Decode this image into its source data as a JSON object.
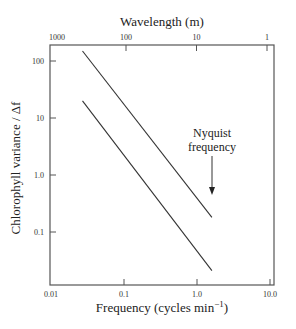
{
  "chart_data": {
    "type": "line",
    "title": "",
    "xlabel": "Frequency (cycles min⁻¹)",
    "ylabel": "Chlorophyll variance / Δf",
    "top_xlabel": "Wavelength (m)",
    "xscale": "log",
    "yscale": "log",
    "xlim": [
      0.01,
      10.0
    ],
    "ylim": [
      0.01,
      200
    ],
    "x_ticks": [
      0.01,
      0.1,
      1.0,
      10.0
    ],
    "x_tick_labels": [
      "0.01",
      "0.1",
      "1.0",
      "10.0"
    ],
    "y_ticks": [
      0.1,
      1.0,
      10,
      100
    ],
    "y_tick_labels": [
      "0.1",
      "1.0",
      "10",
      "100"
    ],
    "top_ticks": [
      1000,
      100,
      10,
      1
    ],
    "top_tick_labels": [
      "1000",
      "100",
      "10",
      "1"
    ],
    "grid": false,
    "legend": null,
    "series": [
      {
        "name": "upper",
        "x": [
          0.027,
          1.6
        ],
        "y": [
          150,
          0.18
        ]
      },
      {
        "name": "lower",
        "x": [
          0.027,
          1.6
        ],
        "y": [
          20,
          0.021
        ]
      }
    ],
    "annotations": [
      {
        "text": "Nyquist frequency",
        "x": 1.6,
        "arrow_from_y": 3.5,
        "arrow_to_y": 0.75
      }
    ]
  },
  "labels": {
    "top_title": "Wavelength (m)",
    "x_title": "Frequency (cycles min",
    "x_title_sup": "−1",
    "x_title_end": ")",
    "y_title": "Chlorophyll variance / Δf",
    "nyquist_line1": "Nyquist",
    "nyquist_line2": "frequency"
  }
}
